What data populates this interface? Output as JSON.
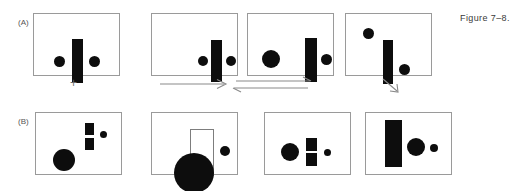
{
  "figure": {
    "caption": "Figure 7–8.",
    "rows": [
      {
        "label": "(A)",
        "panels": [
          {
            "name": "panel-a1",
            "description": "two small dots flanking a vertical bar",
            "shapes": [
              {
                "kind": "dot",
                "x": 20,
                "y": 42,
                "w": 11,
                "h": 11
              },
              {
                "kind": "bar",
                "x": 38,
                "y": 25,
                "w": 11,
                "h": 44
              },
              {
                "kind": "dot",
                "x": 55,
                "y": 42,
                "w": 11,
                "h": 11
              }
            ]
          },
          {
            "name": "panel-a2",
            "description": "dot pair and bar shifted to the right side",
            "shapes": [
              {
                "kind": "dot",
                "x": 46,
                "y": 42,
                "w": 10,
                "h": 10
              },
              {
                "kind": "bar",
                "x": 59,
                "y": 26,
                "w": 11,
                "h": 42
              },
              {
                "kind": "dot",
                "x": 74,
                "y": 42,
                "w": 10,
                "h": 10
              }
            ]
          },
          {
            "name": "panel-a3",
            "description": "large dot at left, bar with small dot at right",
            "shapes": [
              {
                "kind": "dot",
                "x": 14,
                "y": 36,
                "w": 18,
                "h": 18
              },
              {
                "kind": "bar",
                "x": 57,
                "y": 24,
                "w": 12,
                "h": 44
              },
              {
                "kind": "dot",
                "x": 73,
                "y": 40,
                "w": 11,
                "h": 11
              }
            ]
          },
          {
            "name": "panel-a4",
            "description": "dot upper-left, tall bar centered, dot lower-right",
            "shapes": [
              {
                "kind": "dot",
                "x": 17,
                "y": 14,
                "w": 11,
                "h": 11
              },
              {
                "kind": "bar",
                "x": 37,
                "y": 26,
                "w": 10,
                "h": 44
              },
              {
                "kind": "dot",
                "x": 53,
                "y": 50,
                "w": 11,
                "h": 11
              }
            ]
          }
        ],
        "connectors": [
          {
            "name": "plus-connector",
            "glyph": "plus",
            "label": "+"
          },
          {
            "name": "single-arrow-connector",
            "glyph": "arrow-right",
            "label": ""
          },
          {
            "name": "equilibrium-arrow-connector",
            "glyph": "double-arrow",
            "label": ""
          },
          {
            "name": "diagonal-arrow-connector",
            "glyph": "arrow-down-right",
            "label": ""
          }
        ]
      },
      {
        "label": "(B)",
        "panels": [
          {
            "name": "panel-b1",
            "description": "segmented bar upper-right, small dot right, large dot lower-left",
            "shapes": [
              {
                "kind": "bar-split",
                "x": 49,
                "y": 10,
                "w": 9,
                "h": 27
              },
              {
                "kind": "dot",
                "x": 64,
                "y": 18,
                "w": 7,
                "h": 7
              },
              {
                "kind": "dot",
                "x": 17,
                "y": 36,
                "w": 22,
                "h": 22
              }
            ]
          },
          {
            "name": "panel-b2",
            "description": "open rectangle with black semicircle breaking the bottom edge, dot at right",
            "shapes": [
              {
                "kind": "open-rect",
                "x": 38,
                "y": 16,
                "w": 24,
                "h": 47
              },
              {
                "kind": "semicircle",
                "x": 22,
                "y": 40,
                "w": 40,
                "h": 40
              },
              {
                "kind": "dot",
                "x": 68,
                "y": 33,
                "w": 10,
                "h": 10
              }
            ]
          },
          {
            "name": "panel-b3",
            "description": "large dot, segmented bar, tiny dot in a row",
            "shapes": [
              {
                "kind": "dot",
                "x": 16,
                "y": 30,
                "w": 18,
                "h": 18
              },
              {
                "kind": "bar-split",
                "x": 41,
                "y": 25,
                "w": 11,
                "h": 28
              },
              {
                "kind": "dot",
                "x": 59,
                "y": 36,
                "w": 7,
                "h": 7
              }
            ]
          },
          {
            "name": "panel-b4",
            "description": "wide tall bar at left, large dot, small dot",
            "shapes": [
              {
                "kind": "bar",
                "x": 19,
                "y": 7,
                "w": 17,
                "h": 47
              },
              {
                "kind": "dot",
                "x": 41,
                "y": 25,
                "w": 18,
                "h": 18
              },
              {
                "kind": "dot",
                "x": 64,
                "y": 31,
                "w": 8,
                "h": 8
              }
            ]
          }
        ],
        "connectors": []
      }
    ]
  },
  "colors": {
    "ink": "#0d0d0d",
    "panel_border": "#9a9a9a",
    "connector": "#8a8a8a",
    "caption_text": "#3a3a3a",
    "label_text": "#555555",
    "background": "#ffffff"
  }
}
